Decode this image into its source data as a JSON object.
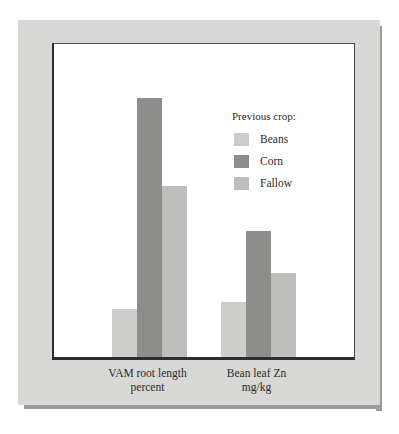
{
  "chart_data": {
    "type": "bar",
    "title": "",
    "subtitle": "",
    "xlabel": "",
    "ylabel": "",
    "ylim": [
      10,
      70
    ],
    "ytick_values": [
      70,
      60,
      50,
      40,
      30,
      20,
      10
    ],
    "ytick_labels": [
      "70",
      "60",
      "50",
      "40",
      "30",
      "20",
      "10"
    ],
    "grid": false,
    "legend_position": "inside-upper-right",
    "legend_title": "Previous crop:",
    "categories": [
      "VAM root length percent",
      "Bean leaf Zn mg/kg"
    ],
    "category_label_lines": [
      [
        "VAM root length",
        "percent"
      ],
      [
        "Bean leaf Zn",
        "mg/kg"
      ]
    ],
    "series": [
      {
        "name": "Beans",
        "color": "#cdcdcb",
        "values": [
          19.3,
          20.5
        ]
      },
      {
        "name": "Corn",
        "color": "#8d8d8b",
        "values": [
          59.7,
          34.2
        ]
      },
      {
        "name": "Fallow",
        "color": "#bdbdbb",
        "values": [
          42.8,
          26.1
        ]
      }
    ]
  },
  "figure": {
    "panel_color": "#d8d8d6",
    "shadow_color": "#9a9a98",
    "plot_background": "#ffffff",
    "axis_color": "#2e2e2e",
    "text_color": "#2a2a2a"
  }
}
